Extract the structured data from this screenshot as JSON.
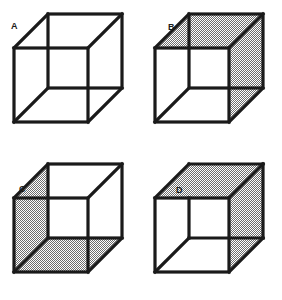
{
  "figure": {
    "background_color": "#ffffff",
    "line_color": "#1a1a1a",
    "shade_color": "#8c8c8c",
    "face_fill": "#ffffff",
    "panels": [
      {
        "id": "A",
        "label": "A",
        "description": "Transparent wireframe Necker cube with no shaded faces",
        "shaded_faces": [],
        "inner_vertex": "upper-left-of-front-square"
      },
      {
        "id": "B",
        "label": "B",
        "description": "Necker cube with shaded top face and shaded right face",
        "shaded_faces": [
          "top",
          "right"
        ],
        "inner_vertex": "upper-left-of-front-square"
      },
      {
        "id": "C",
        "label": "C",
        "description": "Necker cube with shaded left face and shaded bottom face",
        "shaded_faces": [
          "left",
          "bottom"
        ],
        "inner_vertex": "upper-left-of-front-square"
      },
      {
        "id": "D",
        "label": "D",
        "description": "Necker cube with shaded top face and shaded right face, opposite depth reading",
        "shaded_faces": [
          "top",
          "right"
        ],
        "inner_vertex": "lower-right-of-back-square"
      }
    ],
    "geometry": {
      "front_square": {
        "left": 14,
        "top": 48,
        "right": 88,
        "bottom": 122
      },
      "back_square": {
        "left": 48,
        "top": 14,
        "right": 122,
        "bottom": 88
      },
      "stroke_width": 3.2
    }
  }
}
